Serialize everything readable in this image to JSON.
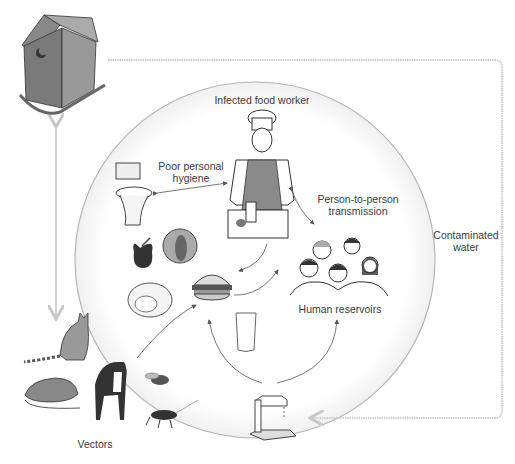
{
  "diagram": {
    "labels": {
      "center_top": "Infected food worker",
      "hygiene_line1": "Poor personal",
      "hygiene_line2": "hygiene",
      "p2p_line1": "Person-to-person",
      "p2p_line2": "transmission",
      "reservoirs": "Human reservoirs",
      "water_line1": "Contaminated",
      "water_line2": "water",
      "vectors": "Vectors"
    },
    "nodes": [
      {
        "id": "outhouse",
        "icon": "outhouse-icon"
      },
      {
        "id": "food-worker",
        "icon": "chef-icon"
      },
      {
        "id": "toilet",
        "icon": "toilet-icon"
      },
      {
        "id": "apple",
        "icon": "apple-icon"
      },
      {
        "id": "melon",
        "icon": "melon-icon"
      },
      {
        "id": "cabbage",
        "icon": "cabbage-icon"
      },
      {
        "id": "burger",
        "icon": "burger-icon"
      },
      {
        "id": "glass",
        "icon": "glass-icon"
      },
      {
        "id": "people",
        "icon": "people-group-icon"
      },
      {
        "id": "faucet",
        "icon": "faucet-icon"
      },
      {
        "id": "cat",
        "icon": "cat-icon"
      },
      {
        "id": "rat",
        "icon": "rat-icon"
      },
      {
        "id": "dog",
        "icon": "dog-icon"
      },
      {
        "id": "fly",
        "icon": "fly-icon"
      },
      {
        "id": "cockroach",
        "icon": "cockroach-icon"
      }
    ],
    "colors": {
      "line": "#c8c8c8",
      "arrow": "#555555",
      "text": "#3a3a3a"
    }
  }
}
